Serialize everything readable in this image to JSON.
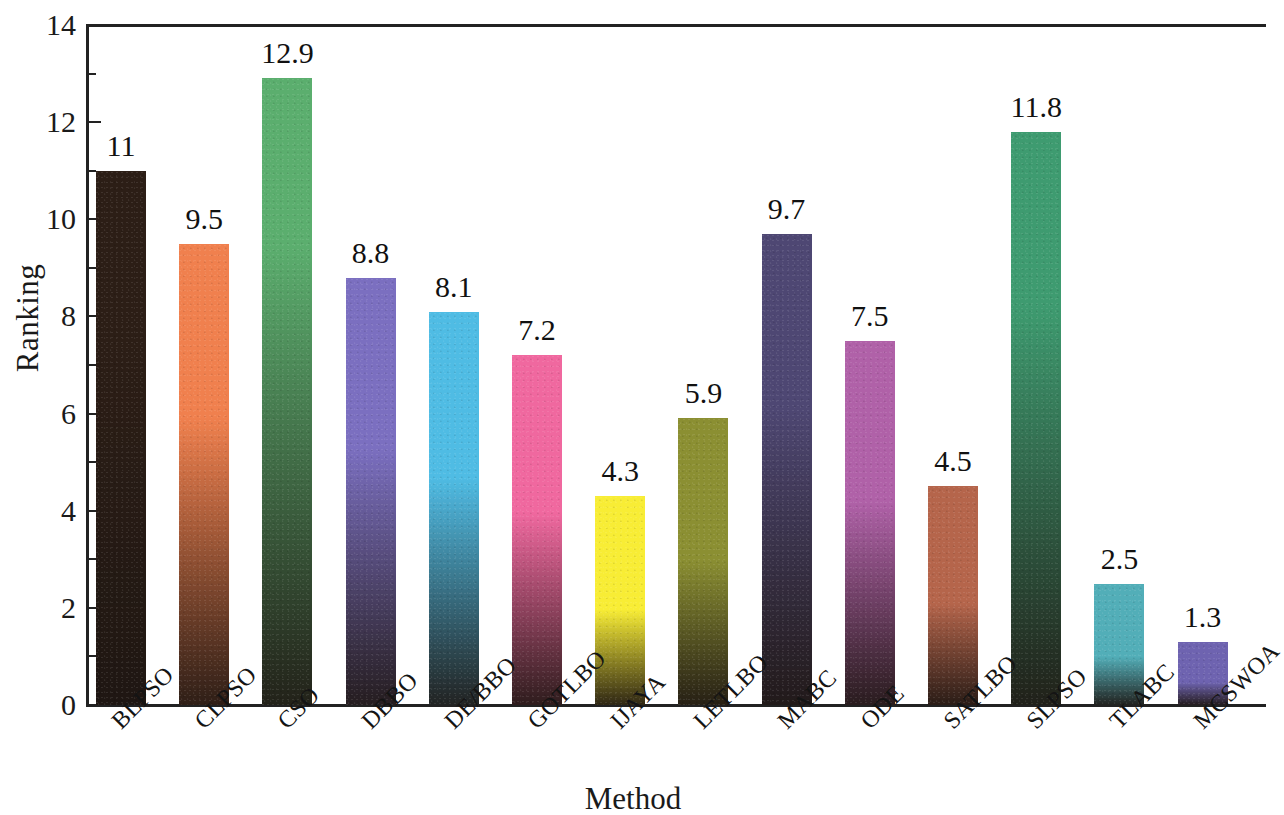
{
  "chart_data": {
    "type": "bar",
    "title": "",
    "xlabel": "Method",
    "ylabel": "Ranking",
    "ylim": [
      0,
      14
    ],
    "yticks": [
      0,
      2,
      4,
      6,
      8,
      10,
      12,
      14
    ],
    "ytick_labels": [
      "0",
      "2",
      "4",
      "6",
      "8",
      "10",
      "12",
      "14"
    ],
    "minor_yticks": [
      1,
      3,
      5,
      7,
      9,
      11,
      13
    ],
    "grid": false,
    "legend": "none",
    "categories": [
      "BLPSO",
      "CLPSO",
      "CSO",
      "DBBO",
      "DE/BBO",
      "GOTLBO",
      "IJAYA",
      "LETLBO",
      "MABC",
      "ODE",
      "SATLBO",
      "SLPSO",
      "TLABC",
      "MCSWOA"
    ],
    "values": [
      11,
      9.5,
      12.9,
      8.8,
      8.1,
      7.2,
      4.3,
      5.9,
      9.7,
      7.5,
      4.5,
      11.8,
      2.5,
      1.3
    ],
    "value_labels": [
      "11",
      "9.5",
      "12.9",
      "8.8",
      "8.1",
      "7.2",
      "4.3",
      "5.9",
      "9.7",
      "7.5",
      "4.5",
      "11.8",
      "2.5",
      "1.3"
    ],
    "bar_colors": [
      "#2C1E16",
      "#F0804E",
      "#5BAE6E",
      "#7B6FC0",
      "#4FBCE4",
      "#F0689F",
      "#F8ED35",
      "#8B8F32",
      "#4E4773",
      "#B061A8",
      "#B5654B",
      "#3E9B70",
      "#52AEB8",
      "#6E63B0"
    ]
  },
  "axis": {
    "y_label": "Ranking",
    "x_label": "Method"
  }
}
